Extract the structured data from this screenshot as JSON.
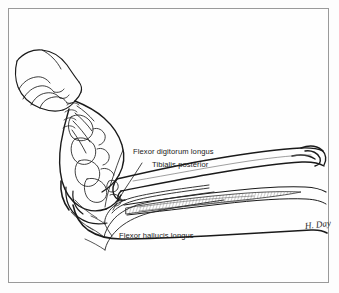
{
  "figure": {
    "background_color": "#fdfdfd",
    "frame_color": "#9a9a9a",
    "ink_color": "#1a1a1a"
  },
  "labels": [
    {
      "id": "fdl",
      "text": "Flexor digitorum longus",
      "name": "label-flexor-digitorum-longus"
    },
    {
      "id": "tp",
      "text": "Tibialis posterior",
      "name": "label-tibialis-posterior"
    },
    {
      "id": "fhl",
      "text": "Flexor hallucis longus",
      "name": "label-flexor-hallucis-longus"
    }
  ],
  "signature": {
    "text": "H. Day"
  },
  "structures": [
    {
      "name": "hand-grasping-forefoot"
    },
    {
      "name": "foot-skeleton"
    },
    {
      "name": "tibia"
    },
    {
      "name": "fibula"
    },
    {
      "name": "calf-soft-tissue-outline"
    },
    {
      "name": "flexor-hallucis-longus-muscle-belly"
    },
    {
      "name": "tendon-bundle-medial-malleolus"
    }
  ]
}
